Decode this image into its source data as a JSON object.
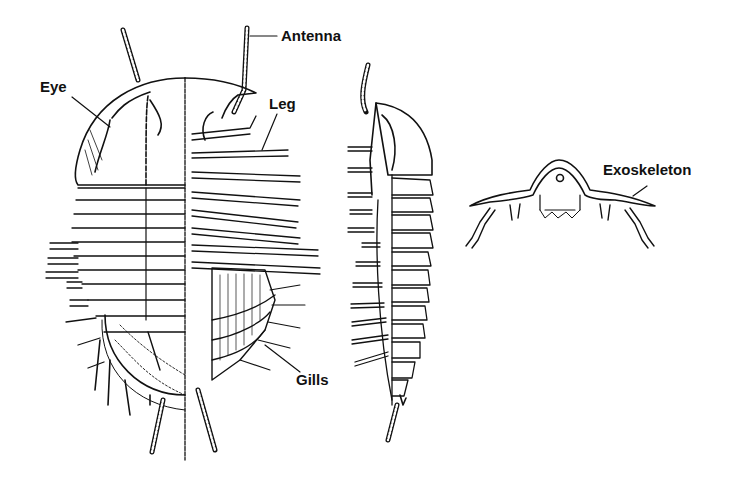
{
  "diagram": {
    "views": [
      {
        "id": "dorsal-ventral",
        "description": "Top view: left half dorsal, right half ventral with legs and gills"
      },
      {
        "id": "lateral",
        "description": "Side view"
      },
      {
        "id": "cross-section",
        "description": "Cross-section view"
      }
    ],
    "labels": {
      "antenna": "Antenna",
      "eye": "Eye",
      "leg": "Leg",
      "gills": "Gills",
      "exoskeleton": "Exoskeleton"
    },
    "colors": {
      "background": "#ffffff",
      "ink": "#111111"
    }
  }
}
